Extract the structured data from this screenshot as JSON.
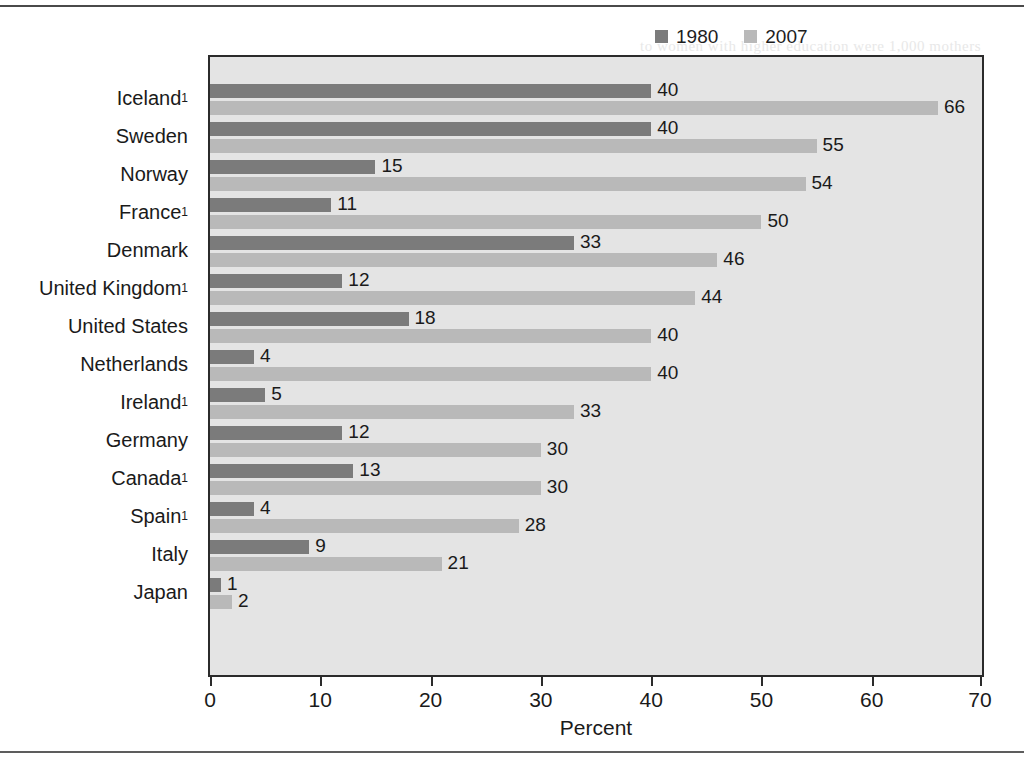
{
  "chart_data": {
    "type": "bar",
    "orientation": "horizontal",
    "title": "",
    "xlabel": "Percent",
    "ylabel": "",
    "xlim": [
      0,
      70
    ],
    "xticks": [
      0,
      10,
      20,
      30,
      40,
      50,
      60,
      70
    ],
    "grid": false,
    "legend_position": "top-right",
    "categories": [
      "Iceland",
      "Sweden",
      "Norway",
      "France",
      "Denmark",
      "United Kingdom",
      "United States",
      "Netherlands",
      "Ireland",
      "Germany",
      "Canada",
      "Spain",
      "Italy",
      "Japan"
    ],
    "category_footnotes": [
      "1",
      "",
      "",
      "1",
      "",
      "1",
      "",
      "",
      "1",
      "",
      "1",
      "1",
      "",
      ""
    ],
    "series": [
      {
        "name": "1980",
        "color": "#7b7b7b",
        "values": [
          40,
          40,
          15,
          11,
          33,
          12,
          18,
          4,
          5,
          12,
          13,
          4,
          9,
          1
        ]
      },
      {
        "name": "2007",
        "color": "#b9b9b9",
        "values": [
          66,
          55,
          54,
          50,
          46,
          44,
          40,
          40,
          33,
          30,
          30,
          28,
          21,
          2
        ]
      }
    ]
  },
  "legend": {
    "entries": [
      {
        "label": "1980",
        "color": "#7b7b7b"
      },
      {
        "label": "2007",
        "color": "#b9b9b9"
      }
    ]
  },
  "axis": {
    "x_title": "Percent",
    "tick_labels": [
      "0",
      "10",
      "20",
      "30",
      "40",
      "50",
      "60",
      "70"
    ]
  },
  "colors": {
    "series_1980": "#7b7b7b",
    "series_2007": "#b9b9b9",
    "plot_background": "#e4e4e4",
    "frame": "#2b2b2b",
    "text": "#1a1a1a"
  },
  "bleed_text": {
    "lines": [
      "to women with higher education were 1,000 mothers",
      "and women with less than a high school",
      "age (2.5%). For women who did not complete",
      "Caucasian women (1.9 percent).",
      "to education in the population and",
      "in fact, while 10.3 percent of women in",
      "a number of variables in the birth",
      "being level in 2007.",
      "(Table 2-3). Almost two-thirds of",
      "hood who have not had children",
      "during the age and education level to",
      "to be employed (U.S. Census Bureau,",
      "Population Survey from 1980 to 2007, and these",
      "years before, in addition to income by",
      "with, they also vary by degree within",
      "and education."
    ],
    "heading": "n Parenthood",
    "footer_note": "Edited by: ..."
  }
}
